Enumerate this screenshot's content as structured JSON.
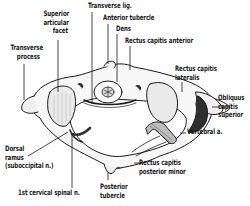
{
  "figure": {
    "colors": {
      "ink": "#1a1a1a",
      "background": "#ffffff",
      "bone_fill": "#f4f4f4",
      "shade": "#3a3a3a"
    }
  },
  "labels": {
    "superior_articular_facet": {
      "lines": [
        "Superior",
        "articular",
        "facet"
      ]
    },
    "transverse_lig": {
      "lines": [
        "Transverse lig."
      ]
    },
    "anterior_tubercle": {
      "lines": [
        "Anterior tubercle"
      ]
    },
    "dens": {
      "lines": [
        "Dens"
      ]
    },
    "rectus_capitis_anterior": {
      "lines": [
        "Rectus capitis anterior"
      ]
    },
    "transverse_process": {
      "lines": [
        "Transverse",
        "process"
      ]
    },
    "rectus_capitis_lateralis": {
      "lines": [
        "Rectus capitis",
        "lateralis"
      ]
    },
    "obliquus_capitis_superior": {
      "lines": [
        "Obliquus",
        "capitis",
        "superior"
      ]
    },
    "vertebral_a": {
      "lines": [
        "Vertebral a."
      ]
    },
    "dorsal_ramus": {
      "lines": [
        "Dorsal",
        "ramus",
        "(suboccipital n.)"
      ]
    },
    "rectus_capitis_posterior_minor": {
      "lines": [
        "Rectus capitis",
        "posterior minor"
      ]
    },
    "first_cervical_spinal_n": {
      "lines": [
        "1st cervical spinal n."
      ]
    },
    "posterior_tubercle": {
      "lines": [
        "Posterior",
        "tubercle"
      ]
    }
  }
}
